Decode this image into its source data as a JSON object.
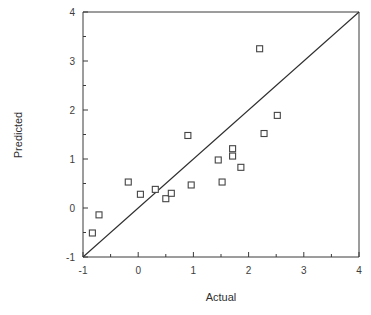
{
  "chart_data": {
    "type": "scatter",
    "title": "",
    "xlabel": "Actual",
    "ylabel": "Predicted",
    "xlim": [
      -1,
      4
    ],
    "ylim": [
      -1,
      4
    ],
    "xticks": [
      -1,
      0,
      1,
      2,
      3,
      4
    ],
    "xticklabels": [
      "-1",
      "0",
      "1",
      "2",
      "3",
      "4"
    ],
    "yticks": [
      -1,
      0,
      1,
      2,
      3,
      4
    ],
    "yticklabels": [
      "-1",
      "0",
      "1",
      "2",
      "3",
      "4"
    ],
    "minor_ticks": true,
    "grid": false,
    "legend": null,
    "marker": "square-open",
    "marker_color": "#444444",
    "reference_line": {
      "label": "y = x identity line",
      "x": [
        -1,
        4
      ],
      "y": [
        -1,
        4
      ],
      "color": "#2e2e2e"
    },
    "points": [
      {
        "x": -0.83,
        "y": -0.51
      },
      {
        "x": -0.71,
        "y": -0.14
      },
      {
        "x": -0.18,
        "y": 0.53
      },
      {
        "x": 0.04,
        "y": 0.28
      },
      {
        "x": 0.31,
        "y": 0.38
      },
      {
        "x": 0.5,
        "y": 0.19
      },
      {
        "x": 0.6,
        "y": 0.3
      },
      {
        "x": 0.9,
        "y": 1.48
      },
      {
        "x": 0.96,
        "y": 0.47
      },
      {
        "x": 1.45,
        "y": 0.98
      },
      {
        "x": 1.52,
        "y": 0.53
      },
      {
        "x": 1.71,
        "y": 1.21
      },
      {
        "x": 1.71,
        "y": 1.06
      },
      {
        "x": 1.86,
        "y": 0.83
      },
      {
        "x": 2.2,
        "y": 3.25
      },
      {
        "x": 2.28,
        "y": 1.52
      },
      {
        "x": 2.52,
        "y": 1.89
      }
    ]
  },
  "axes": {
    "x_title": "Actual",
    "y_title": "Predicted"
  }
}
